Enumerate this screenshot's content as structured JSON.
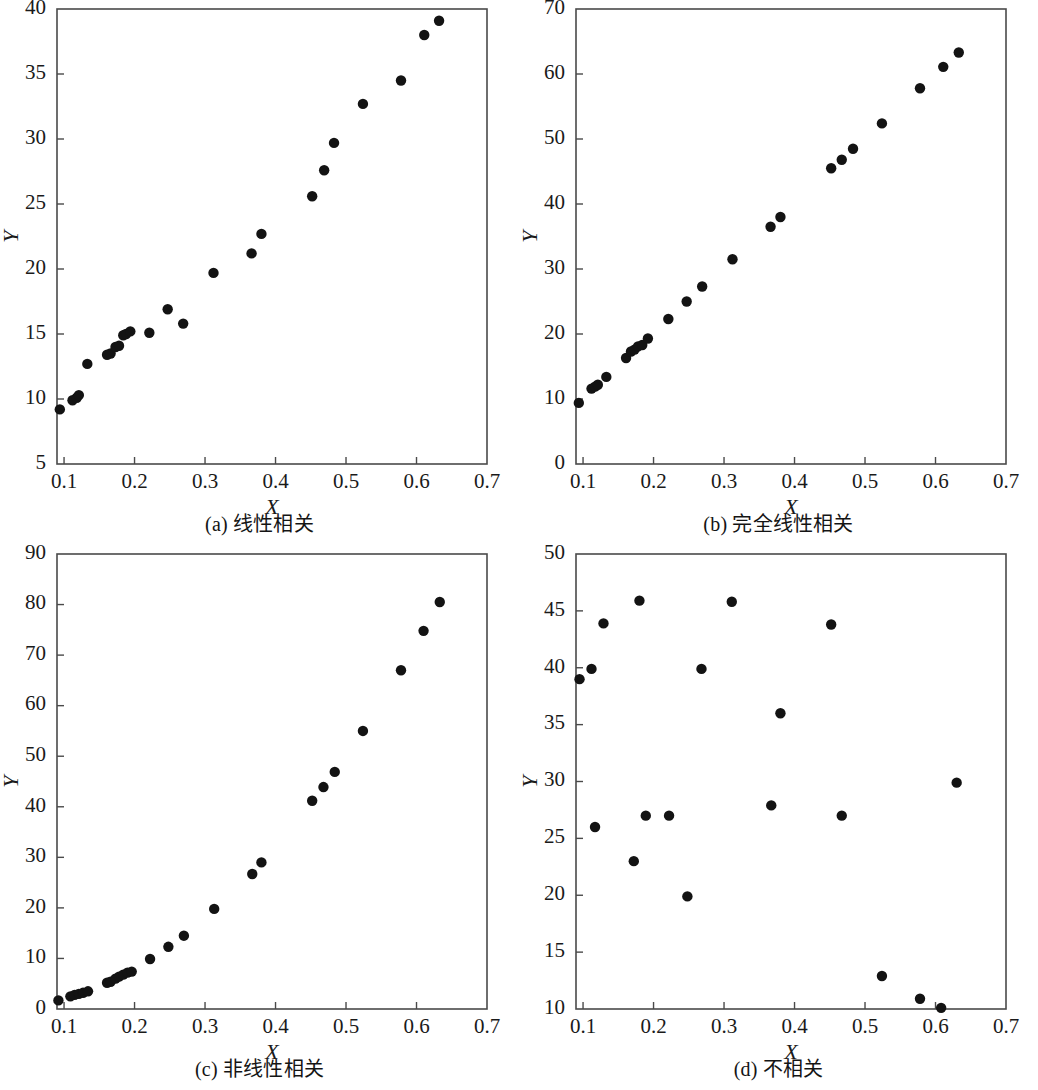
{
  "figure": {
    "panel_count": 4,
    "marker_color": "#131313",
    "axis_color": "#4a4a4a",
    "background": "#ffffff"
  },
  "chart_data": [
    {
      "type": "scatter",
      "panel": "a",
      "caption": "(a) 线性相关",
      "title": "",
      "xlabel": "X",
      "ylabel": "Y",
      "xlim": [
        0.09,
        0.7
      ],
      "ylim": [
        5,
        40
      ],
      "xticks": [
        0.1,
        0.2,
        0.3,
        0.4,
        0.5,
        0.6,
        0.7
      ],
      "xtick_labels": [
        "0.1",
        "0.2",
        "0.3",
        "0.4",
        "0.5",
        "0.6",
        "0.7"
      ],
      "yticks": [
        5,
        10,
        15,
        20,
        25,
        30,
        35,
        40
      ],
      "ytick_labels": [
        "5",
        "10",
        "15",
        "20",
        "25",
        "30",
        "35",
        "40"
      ],
      "grid": false,
      "legend": null,
      "x": [
        0.094,
        0.112,
        0.118,
        0.121,
        0.133,
        0.161,
        0.166,
        0.173,
        0.178,
        0.184,
        0.188,
        0.194,
        0.221,
        0.247,
        0.269,
        0.312,
        0.366,
        0.38,
        0.452,
        0.469,
        0.483,
        0.524,
        0.578,
        0.611,
        0.632
      ],
      "y": [
        9.2,
        9.9,
        10.1,
        10.3,
        12.7,
        13.4,
        13.5,
        14.0,
        14.1,
        14.9,
        15.0,
        15.2,
        15.1,
        16.9,
        15.8,
        19.7,
        21.2,
        22.7,
        25.6,
        27.6,
        29.7,
        32.7,
        34.5,
        38.0,
        39.1
      ]
    },
    {
      "type": "scatter",
      "panel": "b",
      "caption": "(b) 完全线性相关",
      "title": "",
      "xlabel": "X",
      "ylabel": "Y",
      "xlim": [
        0.09,
        0.7
      ],
      "ylim": [
        0,
        70
      ],
      "xticks": [
        0.1,
        0.2,
        0.3,
        0.4,
        0.5,
        0.6,
        0.7
      ],
      "xtick_labels": [
        "0.1",
        "0.2",
        "0.3",
        "0.4",
        "0.5",
        "0.6",
        "0.7"
      ],
      "yticks": [
        0,
        10,
        20,
        30,
        40,
        50,
        60,
        70
      ],
      "ytick_labels": [
        "0",
        "10",
        "20",
        "30",
        "40",
        "50",
        "60",
        "70"
      ],
      "grid": false,
      "legend": null,
      "x": [
        0.094,
        0.112,
        0.117,
        0.121,
        0.133,
        0.161,
        0.168,
        0.173,
        0.178,
        0.184,
        0.192,
        0.221,
        0.247,
        0.269,
        0.312,
        0.366,
        0.38,
        0.452,
        0.467,
        0.483,
        0.524,
        0.578,
        0.611,
        0.633
      ],
      "y": [
        9.4,
        11.6,
        11.9,
        12.2,
        13.4,
        16.3,
        17.3,
        17.6,
        18.1,
        18.3,
        19.3,
        22.3,
        25.0,
        27.3,
        31.5,
        36.5,
        38.0,
        45.5,
        46.8,
        48.5,
        52.4,
        57.8,
        61.1,
        63.3
      ]
    },
    {
      "type": "scatter",
      "panel": "c",
      "caption": "(c) 非线性相关",
      "title": "",
      "xlabel": "X",
      "ylabel": "Y",
      "xlim": [
        0.09,
        0.7
      ],
      "ylim": [
        0,
        90
      ],
      "xticks": [
        0.1,
        0.2,
        0.3,
        0.4,
        0.5,
        0.6,
        0.7
      ],
      "xtick_labels": [
        "0.1",
        "0.2",
        "0.3",
        "0.4",
        "0.5",
        "0.6",
        "0.7"
      ],
      "yticks": [
        0,
        10,
        20,
        30,
        40,
        50,
        60,
        70,
        80,
        90
      ],
      "ytick_labels": [
        "0",
        "10",
        "20",
        "30",
        "40",
        "50",
        "60",
        "70",
        "80",
        "90"
      ],
      "grid": false,
      "legend": null,
      "x": [
        0.092,
        0.109,
        0.115,
        0.121,
        0.127,
        0.134,
        0.161,
        0.166,
        0.173,
        0.178,
        0.184,
        0.19,
        0.196,
        0.222,
        0.248,
        0.27,
        0.313,
        0.367,
        0.38,
        0.452,
        0.468,
        0.484,
        0.524,
        0.578,
        0.61,
        0.633
      ],
      "y": [
        1.7,
        2.5,
        2.8,
        3.0,
        3.2,
        3.5,
        5.2,
        5.4,
        6.0,
        6.4,
        6.8,
        7.2,
        7.4,
        9.9,
        12.3,
        14.5,
        19.8,
        26.7,
        29.0,
        41.2,
        43.9,
        46.9,
        55.0,
        67.0,
        74.8,
        80.5
      ]
    },
    {
      "type": "scatter",
      "panel": "d",
      "caption": "(d) 不相关",
      "title": "",
      "xlabel": "X",
      "ylabel": "Y",
      "xlim": [
        0.09,
        0.7
      ],
      "ylim": [
        10,
        50
      ],
      "xticks": [
        0.1,
        0.2,
        0.3,
        0.4,
        0.5,
        0.6,
        0.7
      ],
      "xtick_labels": [
        "0.1",
        "0.2",
        "0.3",
        "0.4",
        "0.5",
        "0.6",
        "0.7"
      ],
      "yticks": [
        10,
        15,
        20,
        25,
        30,
        35,
        40,
        45,
        50
      ],
      "ytick_labels": [
        "10",
        "15",
        "20",
        "25",
        "30",
        "35",
        "40",
        "45",
        "50"
      ],
      "grid": false,
      "legend": null,
      "x": [
        0.095,
        0.112,
        0.117,
        0.129,
        0.172,
        0.18,
        0.189,
        0.222,
        0.248,
        0.268,
        0.311,
        0.367,
        0.38,
        0.452,
        0.467,
        0.524,
        0.578,
        0.608,
        0.63
      ],
      "y": [
        39.0,
        39.9,
        26.0,
        43.9,
        23.0,
        45.9,
        27.0,
        27.0,
        19.9,
        39.9,
        45.8,
        27.9,
        36.0,
        43.8,
        27.0,
        12.9,
        10.9,
        10.1,
        29.9
      ]
    }
  ]
}
